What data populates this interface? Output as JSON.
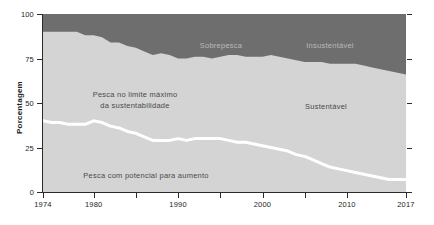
{
  "chart_data": {
    "type": "area",
    "title": "",
    "subtitle": "",
    "xlabel": "",
    "ylabel": "Porcentagem",
    "xlim": [
      1974,
      2017
    ],
    "ylim": [
      0,
      100
    ],
    "grid": false,
    "legend_position": "in-plot-annotations",
    "stacked": true,
    "colors": {
      "unsustainable_band": "#6e6e6e",
      "sustainable_band": "#d4d4d4",
      "divider_line": "#ffffff",
      "axis": "#2b2b2b",
      "plot_background": "#d4d4d4",
      "page_background": "#ffffff"
    },
    "x": [
      1974,
      1975,
      1976,
      1977,
      1978,
      1979,
      1980,
      1981,
      1982,
      1983,
      1984,
      1985,
      1986,
      1987,
      1988,
      1989,
      1990,
      1991,
      1992,
      1993,
      1994,
      1995,
      1996,
      1997,
      1998,
      1999,
      2000,
      2001,
      2002,
      2003,
      2004,
      2005,
      2006,
      2007,
      2008,
      2009,
      2010,
      2011,
      2012,
      2013,
      2014,
      2015,
      2016,
      2017
    ],
    "series": [
      {
        "name": "Pesca com potencial para aumento",
        "label": "Pesca com potencial para aumento",
        "stack_order": 1,
        "color": "#d4d4d4",
        "values": [
          40,
          39,
          39,
          38,
          38,
          38,
          40,
          39,
          37,
          36,
          34,
          33,
          31,
          29,
          29,
          29,
          30,
          29,
          30,
          30,
          30,
          30,
          29,
          28,
          28,
          27,
          26,
          25,
          24,
          23,
          21,
          20,
          18,
          16,
          14,
          13,
          12,
          11,
          10,
          9,
          8,
          7,
          7,
          7
        ]
      },
      {
        "name": "Pesca no limite máximo da sustentabilidade",
        "label": "Pesca no limite máximo da sustentabilidade",
        "stack_order": 2,
        "color": "#d4d4d4",
        "values": [
          50,
          51,
          51,
          52,
          52,
          50,
          48,
          48,
          47,
          48,
          48,
          48,
          48,
          48,
          49,
          48,
          45,
          46,
          46,
          46,
          45,
          46,
          48,
          49,
          48,
          49,
          50,
          52,
          52,
          52,
          53,
          53,
          55,
          57,
          58,
          59,
          60,
          61,
          61,
          61,
          61,
          61,
          60,
          59
        ]
      },
      {
        "name": "Sobrepesca / Insustentável",
        "label": "Sobrepesca",
        "label_right": "Insustentável",
        "stack_order": 3,
        "color": "#6e6e6e",
        "values": [
          10,
          10,
          10,
          10,
          10,
          12,
          12,
          13,
          16,
          16,
          18,
          19,
          21,
          23,
          22,
          23,
          25,
          25,
          24,
          24,
          25,
          24,
          23,
          23,
          24,
          24,
          24,
          23,
          24,
          25,
          26,
          27,
          27,
          27,
          28,
          28,
          28,
          28,
          29,
          30,
          31,
          32,
          33,
          34
        ]
      }
    ],
    "y_ticks": [
      0,
      25,
      50,
      75,
      100
    ],
    "x_ticks": [
      1974,
      1980,
      1990,
      2000,
      2010,
      2017
    ],
    "x_tick_labels": [
      "1974",
      "1980",
      "1990",
      "2000",
      "2010",
      "2017"
    ],
    "x_minor_ticks": [
      1985,
      1995,
      2005
    ],
    "annotations": [
      {
        "id": "sobrepesca",
        "text": "Sobrepesca",
        "x": 1987,
        "y": 93,
        "band": "dark"
      },
      {
        "id": "insustentavel",
        "text": "Insustentável",
        "x": 2007,
        "y": 93,
        "band": "dark"
      },
      {
        "id": "limite-maximo",
        "text": "Pesca no limite máximo da sustentabilidade",
        "x": 1986,
        "y": 58,
        "band": "light"
      },
      {
        "id": "sustentavel",
        "text": "Sustentável",
        "x": 2007,
        "y": 50,
        "band": "light"
      },
      {
        "id": "potencial-aumento",
        "text": "Pesca com potencial para aumento",
        "x": 1988,
        "y": 14,
        "band": "light"
      }
    ]
  },
  "axis": {
    "y_label": "Porcentagem",
    "y_ticks": [
      "100",
      "75",
      "50",
      "25",
      "0"
    ],
    "x_ticks": [
      "1974",
      "1980",
      "1990",
      "2000",
      "2010",
      "2017"
    ]
  },
  "labels": {
    "sobrepesca": "Sobrepesca",
    "insustentavel": "Insustentável",
    "limite_maximo_line1": "Pesca no limite máximo",
    "limite_maximo_line2": "da sustentabilidade",
    "sustentavel": "Sustentável",
    "potencial_aumento": "Pesca com potencial para aumento"
  }
}
